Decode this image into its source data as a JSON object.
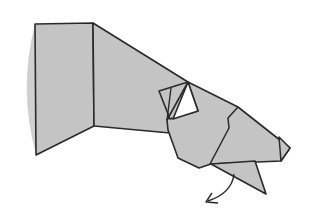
{
  "diagram": {
    "title": "",
    "colors": {
      "paper": "#c4c4c4",
      "paper_edge": "#b0b0b0",
      "line": "#2a2a2a",
      "background": "#ffffff",
      "window": "#ffffff"
    },
    "annotations": [
      {
        "type": "fold-arrow",
        "direction": "down-left"
      }
    ]
  }
}
